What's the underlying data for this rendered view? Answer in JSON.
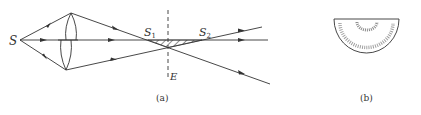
{
  "figure_a": {
    "caption": "(a)",
    "labels": {
      "source": "S",
      "image1_main": "S",
      "image1_sub": "1",
      "image2_main": "S",
      "image2_sub": "2",
      "screen": "E"
    }
  },
  "figure_b": {
    "caption": "(b)"
  },
  "colors": {
    "line": "#333333",
    "hatch": "#444444",
    "fringe": "#777777"
  }
}
